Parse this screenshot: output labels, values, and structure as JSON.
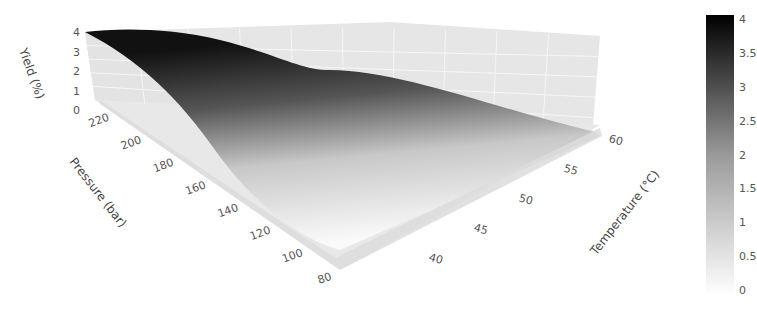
{
  "chart_data": {
    "type": "surface3d",
    "title": "",
    "colorscale": "greys",
    "axes": {
      "x": {
        "label": "Temperature (°C)",
        "ticks": [
          40,
          45,
          50,
          55,
          60
        ],
        "range": [
          35,
          65
        ]
      },
      "y": {
        "label": "Pressure (bar)",
        "ticks": [
          80,
          100,
          120,
          140,
          160,
          180,
          200,
          220
        ],
        "range": [
          70,
          225
        ]
      },
      "z": {
        "label": "Yield (%)",
        "ticks": [
          0,
          1,
          2,
          3,
          4
        ],
        "range": [
          0,
          4
        ]
      }
    },
    "surface": {
      "description": "Yield rises with pressure; max ~4% at high pressure and low temperature, near 0 at low pressure",
      "temperature": [
        35,
        45,
        55,
        65
      ],
      "pressure": [
        70,
        120,
        170,
        225
      ],
      "yield": [
        [
          0.0,
          0.0,
          0.0,
          0.0
        ],
        [
          0.4,
          0.2,
          0.1,
          0.05
        ],
        [
          2.6,
          1.6,
          0.9,
          0.5
        ],
        [
          4.0,
          3.8,
          2.2,
          1.6
        ]
      ]
    },
    "colorbar": {
      "ticks": [
        "0",
        "0.5",
        "1",
        "1.5",
        "2",
        "2.5",
        "3",
        "3.5",
        "4"
      ],
      "range": [
        0,
        4
      ]
    }
  }
}
